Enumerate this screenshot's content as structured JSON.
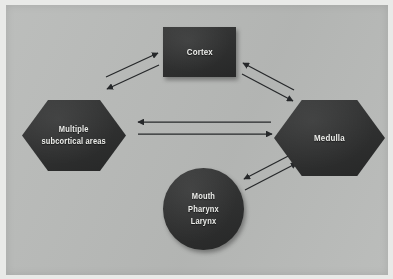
{
  "figure": {
    "background_color": "#b9bbb9",
    "node_color": "#2f3030",
    "label_color": "#ecedea"
  },
  "nodes": [
    {
      "id": "cortex",
      "shape": "rectangle",
      "label": "Cortex"
    },
    {
      "id": "subcortical",
      "shape": "hexagon",
      "label": "Multiple\nsubcortical  areas"
    },
    {
      "id": "medulla",
      "shape": "hexagon",
      "label": "Medulla"
    },
    {
      "id": "periphery",
      "shape": "circle",
      "label": "Mouth\nPharynx\nLarynx"
    }
  ],
  "connections": [
    {
      "id": "cortex-to-subcortical",
      "from": "cortex",
      "to": "subcortical",
      "direction": "bidirectional"
    },
    {
      "id": "cortex-to-medulla",
      "from": "cortex",
      "to": "medulla",
      "direction": "bidirectional"
    },
    {
      "id": "subcortical-to-medulla",
      "from": "subcortical",
      "to": "medulla",
      "direction": "bidirectional"
    },
    {
      "id": "medulla-to-periphery",
      "from": "medulla",
      "to": "periphery",
      "direction": "bidirectional"
    }
  ]
}
